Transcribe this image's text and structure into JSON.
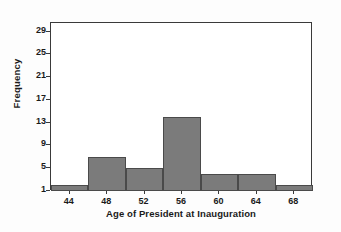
{
  "chart_data": {
    "type": "bar",
    "title": "",
    "xlabel": "Age of President at Inauguration",
    "ylabel": "Frequency",
    "categories": [
      "44",
      "48",
      "52",
      "56",
      "60",
      "64",
      "68"
    ],
    "values": [
      2,
      7,
      5,
      14,
      4,
      4,
      2
    ],
    "bin_edges": [
      42,
      46,
      50,
      54,
      58,
      62,
      66,
      70
    ],
    "bin_width": 4,
    "xlim": [
      42,
      70
    ],
    "ylim": [
      1,
      30.5
    ],
    "xticks": [
      44,
      48,
      52,
      56,
      60,
      64,
      68
    ],
    "yticks": [
      1,
      5,
      9,
      13,
      17,
      21,
      25,
      29
    ],
    "grid": false,
    "legend": false,
    "bar_fill_color": "#7b7b7b",
    "bar_edge_color": "#4a4a4a",
    "axis_color": "#3a3a3a",
    "background_color": "#ffffff"
  }
}
